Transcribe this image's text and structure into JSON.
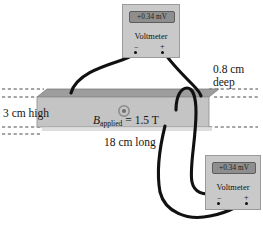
{
  "figure": {
    "colors": {
      "slab_front": "#c4c4c4",
      "slab_top": "#9d9d9d",
      "meter_body": "#c9c9c9",
      "meter_screen": "#8e8e8e",
      "wire": "#111111",
      "dashed_line": "#4a4a4a",
      "text": "#141414"
    }
  },
  "voltmeters": [
    {
      "id": "top",
      "reading": "+0.34 mV",
      "label": "Voltmeter",
      "terminals": {
        "negative": "−",
        "positive": "+"
      }
    },
    {
      "id": "bottom",
      "reading": "+0.34 mV",
      "label": "Voltmeter",
      "terminals": {
        "negative": "−",
        "positive": "+"
      }
    }
  ],
  "slab": {
    "field_symbol": "circle-dot-out-of-page",
    "field_quantity": "B",
    "field_subscript": "applied",
    "field_equals": " = 1.5 T",
    "field_text": "B_applied = 1.5 T"
  },
  "dimensions": {
    "height": "3 cm high",
    "depth_line1": "0.8 cm",
    "depth_line2": "deep",
    "length": "18 cm long"
  }
}
